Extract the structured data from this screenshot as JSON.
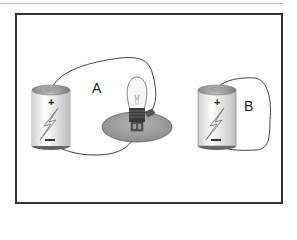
{
  "diagram": {
    "labels": {
      "a": "A",
      "b": "B"
    },
    "components": [
      {
        "name": "battery-a",
        "polarity_top": "+",
        "polarity_bottom": "-"
      },
      {
        "name": "bulb-in-holder"
      },
      {
        "name": "battery-b",
        "polarity_top": "+",
        "polarity_bottom": "-"
      }
    ],
    "colors": {
      "frame": "#333333",
      "battery_body": "#f2f2f2",
      "battery_cap": "#9a9a9a",
      "holder": "#a8a8a8",
      "wire": "#444444"
    }
  }
}
